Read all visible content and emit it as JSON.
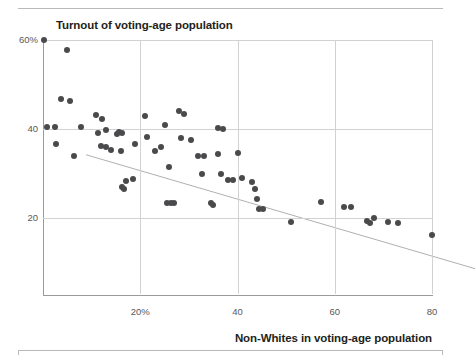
{
  "figure": {
    "title": "Turnout of voting-age population",
    "xaxis_title": "Non-Whites in voting-age population"
  },
  "chart_data": {
    "type": "scatter",
    "title": "Turnout of voting-age population",
    "xlabel": "Non-Whites in voting-age population",
    "ylabel": "Turnout of voting-age population",
    "xlim": [
      0,
      80
    ],
    "ylim": [
      0,
      60
    ],
    "grid": true,
    "legend": null,
    "xticks": [
      20,
      40,
      60,
      80
    ],
    "xtick_labels": [
      "20%",
      "40",
      "60",
      "80"
    ],
    "yticks": [
      20,
      40,
      60
    ],
    "ytick_labels": [
      "20",
      "40",
      "60%"
    ],
    "marker_color": "#4a4a4c",
    "trendline": {
      "type": "linear-fit",
      "color": "#b0b0b0",
      "x_start": 0,
      "y_start": 43.2,
      "x_end": 80,
      "y_end": 17.6
    },
    "points": [
      {
        "x": 0.2,
        "y": 60.0
      },
      {
        "x": 5.0,
        "y": 57.8
      },
      {
        "x": 3.6,
        "y": 46.8
      },
      {
        "x": 5.6,
        "y": 46.3
      },
      {
        "x": 0.8,
        "y": 40.4
      },
      {
        "x": 2.4,
        "y": 40.4
      },
      {
        "x": 7.8,
        "y": 40.4
      },
      {
        "x": 2.6,
        "y": 36.6
      },
      {
        "x": 6.4,
        "y": 34.0
      },
      {
        "x": 11.0,
        "y": 43.2
      },
      {
        "x": 12.2,
        "y": 42.2
      },
      {
        "x": 11.4,
        "y": 39.0
      },
      {
        "x": 12.0,
        "y": 36.2
      },
      {
        "x": 13.0,
        "y": 36.0
      },
      {
        "x": 14.0,
        "y": 35.2
      },
      {
        "x": 13.0,
        "y": 39.7
      },
      {
        "x": 15.2,
        "y": 38.8
      },
      {
        "x": 15.6,
        "y": 39.4
      },
      {
        "x": 16.2,
        "y": 39.0
      },
      {
        "x": 16.0,
        "y": 35.0
      },
      {
        "x": 17.0,
        "y": 28.4
      },
      {
        "x": 16.2,
        "y": 27.0
      },
      {
        "x": 16.6,
        "y": 26.6
      },
      {
        "x": 18.6,
        "y": 28.8
      },
      {
        "x": 19.0,
        "y": 36.6
      },
      {
        "x": 21.0,
        "y": 43.0
      },
      {
        "x": 21.4,
        "y": 38.2
      },
      {
        "x": 23.0,
        "y": 35.0
      },
      {
        "x": 25.0,
        "y": 40.8
      },
      {
        "x": 24.2,
        "y": 36.0
      },
      {
        "x": 26.0,
        "y": 31.4
      },
      {
        "x": 25.6,
        "y": 23.4
      },
      {
        "x": 26.4,
        "y": 23.4
      },
      {
        "x": 27.0,
        "y": 23.4
      },
      {
        "x": 28.0,
        "y": 44.0
      },
      {
        "x": 29.0,
        "y": 43.4
      },
      {
        "x": 28.4,
        "y": 38.0
      },
      {
        "x": 30.4,
        "y": 37.6
      },
      {
        "x": 31.8,
        "y": 34.0
      },
      {
        "x": 33.2,
        "y": 34.0
      },
      {
        "x": 32.6,
        "y": 30.0
      },
      {
        "x": 34.6,
        "y": 23.4
      },
      {
        "x": 35.0,
        "y": 23.0
      },
      {
        "x": 36.0,
        "y": 40.2
      },
      {
        "x": 37.0,
        "y": 40.0
      },
      {
        "x": 36.0,
        "y": 34.4
      },
      {
        "x": 36.6,
        "y": 30.0
      },
      {
        "x": 38.0,
        "y": 28.6
      },
      {
        "x": 39.0,
        "y": 28.6
      },
      {
        "x": 40.0,
        "y": 34.6
      },
      {
        "x": 41.0,
        "y": 29.0
      },
      {
        "x": 43.0,
        "y": 28.2
      },
      {
        "x": 43.6,
        "y": 26.6
      },
      {
        "x": 44.0,
        "y": 24.2
      },
      {
        "x": 44.4,
        "y": 22.0
      },
      {
        "x": 45.2,
        "y": 22.0
      },
      {
        "x": 51.0,
        "y": 19.2
      },
      {
        "x": 57.2,
        "y": 23.6
      },
      {
        "x": 62.0,
        "y": 22.4
      },
      {
        "x": 63.4,
        "y": 22.4
      },
      {
        "x": 66.6,
        "y": 19.4
      },
      {
        "x": 68.0,
        "y": 20.0
      },
      {
        "x": 67.2,
        "y": 18.8
      },
      {
        "x": 71.0,
        "y": 19.0
      },
      {
        "x": 73.0,
        "y": 18.8
      },
      {
        "x": 80.0,
        "y": 16.2
      }
    ]
  }
}
